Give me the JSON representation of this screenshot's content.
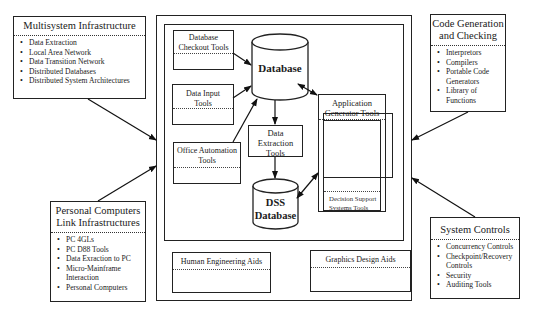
{
  "multisystem": {
    "title": "Multisystem Infrastructure",
    "items": [
      "Data Extraction",
      "Local Area Network",
      "Data Transition Network",
      "Distributed Databases",
      "Distributed System Architectures"
    ]
  },
  "code_generation": {
    "title_line1": "Code Generation",
    "title_line2": "and Checking",
    "items": [
      "Interpretors",
      "Compilers",
      "Portable Code Generators",
      "Library of Functions"
    ]
  },
  "personal_computers": {
    "title_line1": "Personal Computers",
    "title_line2": "Link Infrastructures",
    "items": [
      "PC 4GLs",
      "PC D88 Tools",
      "Data Exraction to PC",
      "Micro-Mainframe Interaction",
      "Personal Computers"
    ]
  },
  "system_controls": {
    "title": "System Controls",
    "items": [
      "Concurrency Controls",
      "Checkpoint/Recovery Controls",
      "Security",
      "Auditing Tools"
    ]
  },
  "center": {
    "db_checkout_line1": "Database",
    "db_checkout_line2": "Checkout Tools",
    "data_input_line1": "Data Input",
    "data_input_line2": "Tools",
    "office_automation_line1": "Office Automation",
    "office_automation_line2": "Tools",
    "database": "Database",
    "data_extraction_line1": "Data",
    "data_extraction_line2": "Extraction",
    "data_extraction_line3": "Tools",
    "dss_line1": "DSS",
    "dss_line2": "Database",
    "app_gen_line1": "Application",
    "app_gen_line2": "Generator Tools",
    "dss_tools_line1": "Decision Support",
    "dss_tools_line2": "Systems Tools",
    "human_engineering": "Human Engineering Aids",
    "graphics_design": "Graphics Design Aids"
  }
}
